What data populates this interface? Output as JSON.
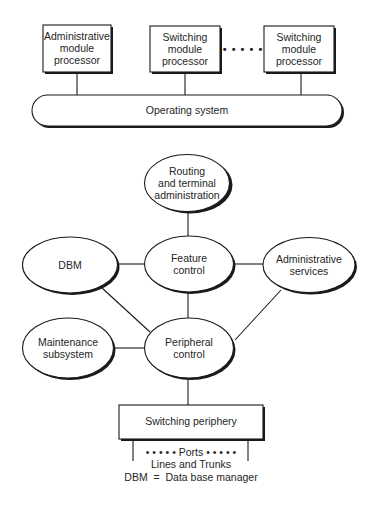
{
  "diagram": {
    "top_modules": [
      {
        "label": "Administrative module processor",
        "lines": [
          "Administrative",
          "module",
          "processor"
        ]
      },
      {
        "label": "Switching module processor",
        "lines": [
          "Switching",
          "module",
          "processor"
        ]
      },
      {
        "label": "Switching module processor",
        "lines": [
          "Switching",
          "module",
          "processor"
        ]
      }
    ],
    "ellipsis_dots": "• • • • •",
    "operating_system": "Operating system",
    "nodes": {
      "routing": {
        "lines": [
          "Routing",
          "and terminal",
          "administration"
        ]
      },
      "dbm": {
        "lines": [
          "DBM"
        ]
      },
      "feature_control": {
        "lines": [
          "Feature",
          "control"
        ]
      },
      "administrative_services": {
        "lines": [
          "Administrative",
          "services"
        ]
      },
      "maintenance": {
        "lines": [
          "Maintenance",
          "subsystem"
        ]
      },
      "peripheral_control": {
        "lines": [
          "Peripheral",
          "control"
        ]
      }
    },
    "switching_periphery": "Switching periphery",
    "ports": "• • • • • Ports • • • • •",
    "lines_and_trunks": "Lines and Trunks",
    "legend": "DBM  =  Data base manager",
    "edges": [
      [
        "admin-module",
        "operating-system"
      ],
      [
        "switching-module-1",
        "operating-system"
      ],
      [
        "switching-module-n",
        "operating-system"
      ],
      [
        "routing",
        "feature-control"
      ],
      [
        "dbm",
        "feature-control"
      ],
      [
        "feature-control",
        "administrative-services"
      ],
      [
        "feature-control",
        "peripheral-control"
      ],
      [
        "dbm",
        "peripheral-control"
      ],
      [
        "administrative-services",
        "peripheral-control"
      ],
      [
        "maintenance",
        "peripheral-control"
      ],
      [
        "peripheral-control",
        "switching-periphery"
      ]
    ],
    "colors": {
      "stroke": "#1a1a1a",
      "text": "#262626",
      "background": "#ffffff"
    }
  }
}
